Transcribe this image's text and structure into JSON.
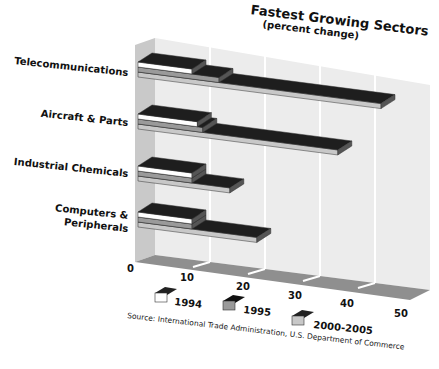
{
  "chart_data": {
    "type": "bar",
    "orientation": "horizontal",
    "style": "3d-stacked-layers",
    "title": "Fastest Growing Sectors",
    "subtitle": "(percent change)",
    "categories": [
      "Telecommunications",
      "Aircraft & Parts",
      "Industrial Chemicals",
      "Computers & Peripherals"
    ],
    "series": [
      {
        "name": "1994",
        "values": [
          10,
          11,
          10,
          10
        ],
        "color": "#ffffff"
      },
      {
        "name": "1995",
        "values": [
          15,
          12,
          10,
          10
        ],
        "color": "#9a9a9a"
      },
      {
        "name": "2000-2005",
        "values": [
          45,
          37,
          17,
          22
        ],
        "color": "#c8c8c8"
      }
    ],
    "xlabel": "",
    "ylabel": "",
    "xticks": [
      "0",
      "10",
      "20",
      "30",
      "40",
      "50"
    ],
    "xlim": [
      0,
      50
    ],
    "grid": true,
    "legend_position": "bottom",
    "source": "Source: International Trade Administration, U.S. Department of Commerce"
  },
  "labels": {
    "title": "Fastest Growing Sectors",
    "subtitle": "(percent change)",
    "cat0": "Telecommunications",
    "cat1": "Aircraft & Parts",
    "cat2": "Industrial Chemicals",
    "cat3a": "Computers &",
    "cat3b": "Peripherals",
    "t0": "0",
    "t1": "10",
    "t2": "20",
    "t3": "30",
    "t4": "40",
    "t5": "50",
    "leg0": "1994",
    "leg1": "1995",
    "leg2": "2000-2005",
    "source": "Source: International Trade Administration, U.S. Department of Commerce"
  }
}
